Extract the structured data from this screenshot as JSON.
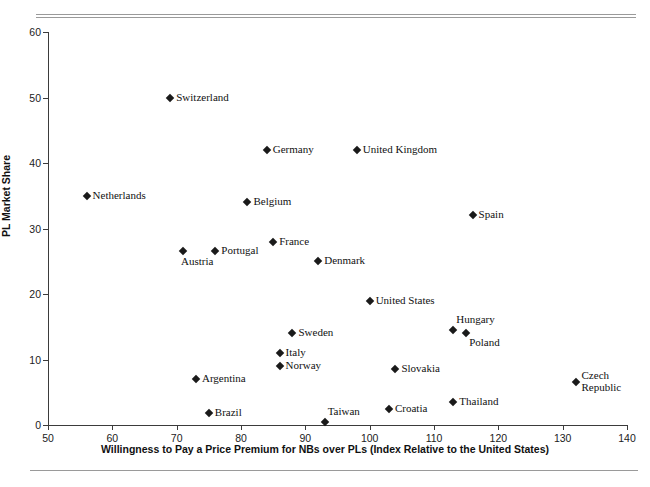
{
  "chart_data": {
    "type": "scatter",
    "title": "",
    "xlabel": "Willingness to Pay a Price Premium for NBs over PLs (Index Relative to the United States)",
    "ylabel": "PL Market Share",
    "xlim": [
      50,
      140
    ],
    "ylim": [
      0,
      60
    ],
    "xticks": [
      50,
      60,
      70,
      80,
      90,
      100,
      110,
      120,
      130,
      140
    ],
    "yticks": [
      0,
      10,
      20,
      30,
      40,
      50,
      60
    ],
    "grid": false,
    "legend": null,
    "marker": "diamond",
    "marker_color": "#1a1a1a",
    "points": [
      {
        "label": "Switzerland",
        "x": 69,
        "y": 50,
        "label_pos": "right"
      },
      {
        "label": "Germany",
        "x": 84,
        "y": 42,
        "label_pos": "right"
      },
      {
        "label": "United Kingdom",
        "x": 98,
        "y": 42,
        "label_pos": "right"
      },
      {
        "label": "Netherlands",
        "x": 56,
        "y": 35,
        "label_pos": "right"
      },
      {
        "label": "Belgium",
        "x": 81,
        "y": 34,
        "label_pos": "right"
      },
      {
        "label": "Spain",
        "x": 116,
        "y": 32,
        "label_pos": "right"
      },
      {
        "label": "France",
        "x": 85,
        "y": 28,
        "label_pos": "right"
      },
      {
        "label": "Portugal",
        "x": 76,
        "y": 26.5,
        "label_pos": "right"
      },
      {
        "label": "Austria",
        "x": 71,
        "y": 26.5,
        "label_pos": "below"
      },
      {
        "label": "Denmark",
        "x": 92,
        "y": 25,
        "label_pos": "right"
      },
      {
        "label": "United States",
        "x": 100,
        "y": 19,
        "label_pos": "right"
      },
      {
        "label": "Hungary",
        "x": 113,
        "y": 14.5,
        "label_pos": "above-right"
      },
      {
        "label": "Poland",
        "x": 115,
        "y": 14,
        "label_pos": "below-right"
      },
      {
        "label": "Sweden",
        "x": 88,
        "y": 14,
        "label_pos": "right"
      },
      {
        "label": "Italy",
        "x": 86,
        "y": 11,
        "label_pos": "right"
      },
      {
        "label": "Norway",
        "x": 86,
        "y": 9,
        "label_pos": "right"
      },
      {
        "label": "Slovakia",
        "x": 104,
        "y": 8.5,
        "label_pos": "right"
      },
      {
        "label": "Argentina",
        "x": 73,
        "y": 7,
        "label_pos": "right"
      },
      {
        "label": "Czech\nRepublic",
        "x": 132,
        "y": 6.5,
        "label_pos": "two-line"
      },
      {
        "label": "Thailand",
        "x": 113,
        "y": 3.5,
        "label_pos": "right"
      },
      {
        "label": "Croatia",
        "x": 103,
        "y": 2.5,
        "label_pos": "right"
      },
      {
        "label": "Brazil",
        "x": 75,
        "y": 1.8,
        "label_pos": "right"
      },
      {
        "label": "Taiwan",
        "x": 93,
        "y": 0.5,
        "label_pos": "above-right"
      }
    ]
  }
}
